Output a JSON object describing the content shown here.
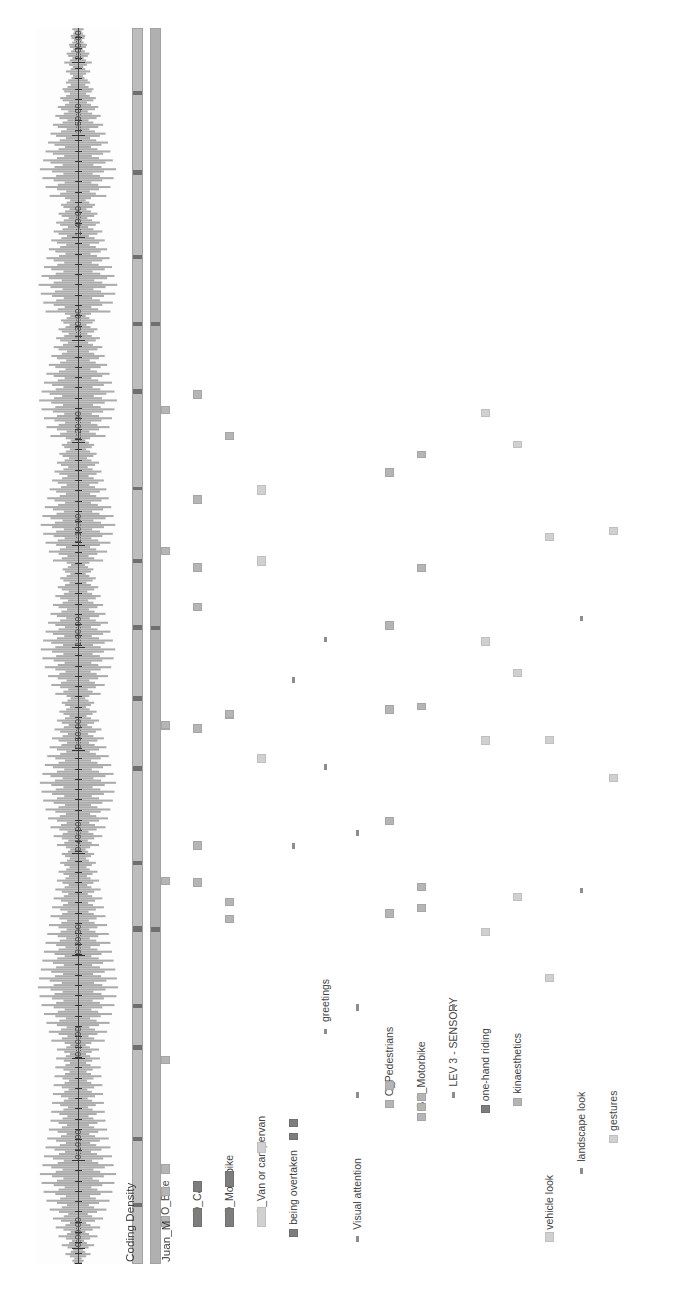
{
  "app": {
    "title": "ELAN Annotation Timeline",
    "orientation": "rotated-90-ccw"
  },
  "colors": {
    "background": "#ffffff",
    "waveform": "#8c8c8c",
    "waveform_axis": "#2a2a2a",
    "strip_fill": "#b6b6b6",
    "strip_segment": "#6f6f6f",
    "annotation_default": "#9a9a9a",
    "annotation_light": "#d0d0d0",
    "annotation_dark": "#7d7d7d",
    "text": "#3c3c3c"
  },
  "tracks": {
    "waveform_name": "",
    "density_name": "Coding Density",
    "participant_name": "Juan_M"
  },
  "timeline": {
    "axis_label": "time",
    "ticks": [
      {
        "label": "0:00:00",
        "pos": 0.012
      },
      {
        "label": "0:10:00",
        "pos": 0.083
      },
      {
        "label": "0:20:00",
        "pos": 0.166
      },
      {
        "label": "0:30:00",
        "pos": 0.249
      },
      {
        "label": "0:40:00",
        "pos": 0.332
      },
      {
        "label": "0:50:00",
        "pos": 0.415
      },
      {
        "label": "1:00:00",
        "pos": 0.498
      },
      {
        "label": "1:10:00",
        "pos": 0.581
      },
      {
        "label": "1:20:00",
        "pos": 0.664
      },
      {
        "label": "1:30:00",
        "pos": 0.747
      },
      {
        "label": "1:40:00",
        "pos": 0.83
      },
      {
        "label": "1:50:00",
        "pos": 0.913
      },
      {
        "label": "2:00:00",
        "pos": 0.972
      }
    ]
  },
  "tiers": [
    {
      "label": "O_Bike",
      "row": 0,
      "annotations": [
        {
          "x": 0.03,
          "w": 0.0085,
          "shade": "mid"
        },
        {
          "x": 0.055,
          "w": 0.0075,
          "shade": "mid"
        },
        {
          "x": 0.073,
          "w": 0.008,
          "shade": "mid"
        },
        {
          "x": 0.162,
          "w": 0.006,
          "shade": "mid"
        },
        {
          "x": 0.307,
          "w": 0.006,
          "shade": "mid"
        },
        {
          "x": 0.432,
          "w": 0.006,
          "shade": "mid"
        },
        {
          "x": 0.433,
          "w": 0.006,
          "shade": "mid"
        },
        {
          "x": 0.574,
          "w": 0.006,
          "shade": "mid"
        },
        {
          "x": 0.688,
          "w": 0.006,
          "shade": "mid"
        }
      ]
    },
    {
      "label": "O_Car",
      "row": 1,
      "annotations": [
        {
          "x": 0.03,
          "w": 0.015,
          "shade": "dark"
        },
        {
          "x": 0.058,
          "w": 0.009,
          "shade": "dark"
        },
        {
          "x": 0.305,
          "w": 0.007,
          "shade": "mid"
        },
        {
          "x": 0.335,
          "w": 0.007,
          "shade": "mid"
        },
        {
          "x": 0.43,
          "w": 0.007,
          "shade": "mid"
        },
        {
          "x": 0.528,
          "w": 0.007,
          "shade": "mid"
        },
        {
          "x": 0.56,
          "w": 0.007,
          "shade": "mid"
        },
        {
          "x": 0.615,
          "w": 0.007,
          "shade": "mid"
        },
        {
          "x": 0.7,
          "w": 0.007,
          "shade": "mid"
        }
      ]
    },
    {
      "label": "O_Motorbike",
      "row": 2,
      "annotations": [
        {
          "x": 0.03,
          "w": 0.015,
          "shade": "dark"
        },
        {
          "x": 0.062,
          "w": 0.013,
          "shade": "dark"
        },
        {
          "x": 0.276,
          "w": 0.006,
          "shade": "mid"
        },
        {
          "x": 0.29,
          "w": 0.006,
          "shade": "mid"
        },
        {
          "x": 0.441,
          "w": 0.006,
          "shade": "mid"
        },
        {
          "x": 0.442,
          "w": 0.006,
          "shade": "mid"
        },
        {
          "x": 0.667,
          "w": 0.006,
          "shade": "mid"
        }
      ]
    },
    {
      "label": "O_Van or campervan",
      "row": 3,
      "annotations": [
        {
          "x": 0.03,
          "w": 0.016,
          "shade": "light"
        },
        {
          "x": 0.09,
          "w": 0.0085,
          "shade": "light"
        },
        {
          "x": 0.405,
          "w": 0.008,
          "shade": "light"
        },
        {
          "x": 0.565,
          "w": 0.008,
          "shade": "light"
        },
        {
          "x": 0.622,
          "w": 0.008,
          "shade": "light"
        }
      ]
    },
    {
      "label": "being overtaken",
      "row": 4,
      "annotations": [
        {
          "x": 0.022,
          "w": 0.0065,
          "shade": "dark"
        },
        {
          "x": 0.1,
          "w": 0.006,
          "shade": "dark"
        },
        {
          "x": 0.111,
          "w": 0.006,
          "shade": "dark"
        },
        {
          "x": 0.336,
          "w": 0.005,
          "shade": "thin"
        },
        {
          "x": 0.47,
          "w": 0.005,
          "shade": "thin"
        }
      ]
    },
    {
      "label": "greetings",
      "row": 5,
      "annotations": [
        {
          "x": 0.186,
          "w": 0.0045,
          "shade": "thin"
        },
        {
          "x": 0.4,
          "w": 0.0045,
          "shade": "thin"
        },
        {
          "x": 0.503,
          "w": 0.0045,
          "shade": "thin"
        }
      ]
    },
    {
      "label": "Visual attention",
      "row": 6,
      "annotations": [
        {
          "x": 0.018,
          "w": 0.005,
          "shade": "thin"
        },
        {
          "x": 0.134,
          "w": 0.005,
          "shade": "thin"
        },
        {
          "x": 0.205,
          "w": 0.005,
          "shade": "thin"
        },
        {
          "x": 0.346,
          "w": 0.005,
          "shade": "thin"
        }
      ]
    },
    {
      "label": "O_Pedestrians",
      "row": 7,
      "annotations": [
        {
          "x": 0.126,
          "w": 0.007,
          "shade": "mid"
        },
        {
          "x": 0.141,
          "w": 0.007,
          "shade": "mid"
        },
        {
          "x": 0.28,
          "w": 0.007,
          "shade": "mid"
        },
        {
          "x": 0.355,
          "w": 0.007,
          "shade": "mid"
        },
        {
          "x": 0.445,
          "w": 0.007,
          "shade": "mid"
        },
        {
          "x": 0.513,
          "w": 0.007,
          "shade": "mid"
        },
        {
          "x": 0.637,
          "w": 0.007,
          "shade": "mid"
        }
      ]
    },
    {
      "label": "BO_Motorbike",
      "row": 8,
      "annotations": [
        {
          "x": 0.116,
          "w": 0.006,
          "shade": "mid"
        },
        {
          "x": 0.124,
          "w": 0.006,
          "shade": "mid"
        },
        {
          "x": 0.132,
          "w": 0.006,
          "shade": "mid"
        },
        {
          "x": 0.285,
          "w": 0.006,
          "shade": "mid"
        },
        {
          "x": 0.302,
          "w": 0.006,
          "shade": "mid"
        },
        {
          "x": 0.448,
          "w": 0.006,
          "shade": "mid"
        },
        {
          "x": 0.56,
          "w": 0.006,
          "shade": "mid"
        },
        {
          "x": 0.652,
          "w": 0.006,
          "shade": "mid"
        }
      ]
    },
    {
      "label": "LEV 3 - SENSORY",
      "row": 9,
      "annotations": [
        {
          "x": 0.134,
          "w": 0.005,
          "shade": "thin"
        },
        {
          "x": 0.205,
          "w": 0.005,
          "shade": "thin"
        }
      ]
    },
    {
      "label": "one-hand riding",
      "row": 10,
      "annotations": [
        {
          "x": 0.122,
          "w": 0.007,
          "shade": "dark"
        },
        {
          "x": 0.265,
          "w": 0.007,
          "shade": "light"
        },
        {
          "x": 0.42,
          "w": 0.007,
          "shade": "light"
        },
        {
          "x": 0.5,
          "w": 0.007,
          "shade": "light"
        },
        {
          "x": 0.685,
          "w": 0.007,
          "shade": "light"
        }
      ]
    },
    {
      "label": "kinaesthetics",
      "row": 11,
      "annotations": [
        {
          "x": 0.128,
          "w": 0.006,
          "shade": "mid"
        },
        {
          "x": 0.294,
          "w": 0.006,
          "shade": "light"
        },
        {
          "x": 0.475,
          "w": 0.006,
          "shade": "light"
        },
        {
          "x": 0.66,
          "w": 0.006,
          "shade": "light"
        }
      ]
    },
    {
      "label": "vehicle look",
      "row": 12,
      "annotations": [
        {
          "x": 0.018,
          "w": 0.0075,
          "shade": "light"
        },
        {
          "x": 0.228,
          "w": 0.0065,
          "shade": "light"
        },
        {
          "x": 0.421,
          "w": 0.0065,
          "shade": "light"
        },
        {
          "x": 0.585,
          "w": 0.0065,
          "shade": "light"
        }
      ]
    },
    {
      "label": "landscape look",
      "row": 13,
      "annotations": [
        {
          "x": 0.073,
          "w": 0.0045,
          "shade": "thin"
        },
        {
          "x": 0.3,
          "w": 0.0045,
          "shade": "thin"
        },
        {
          "x": 0.52,
          "w": 0.0045,
          "shade": "thin"
        }
      ]
    },
    {
      "label": "gestures",
      "row": 14,
      "annotations": [
        {
          "x": 0.098,
          "w": 0.0065,
          "shade": "light"
        },
        {
          "x": 0.39,
          "w": 0.0065,
          "shade": "light"
        },
        {
          "x": 0.59,
          "w": 0.0065,
          "shade": "light"
        }
      ]
    }
  ],
  "density_segments": [
    {
      "x": 0.045,
      "w": 0.0035
    },
    {
      "x": 0.099,
      "w": 0.003
    },
    {
      "x": 0.172,
      "w": 0.004
    },
    {
      "x": 0.206,
      "w": 0.0035
    },
    {
      "x": 0.268,
      "w": 0.005
    },
    {
      "x": 0.322,
      "w": 0.0035
    },
    {
      "x": 0.398,
      "w": 0.004
    },
    {
      "x": 0.455,
      "w": 0.0035
    },
    {
      "x": 0.512,
      "w": 0.0045
    },
    {
      "x": 0.566,
      "w": 0.0035
    },
    {
      "x": 0.625,
      "w": 0.003
    },
    {
      "x": 0.703,
      "w": 0.0045
    },
    {
      "x": 0.758,
      "w": 0.003
    },
    {
      "x": 0.812,
      "w": 0.0035
    },
    {
      "x": 0.88,
      "w": 0.004
    },
    {
      "x": 0.945,
      "w": 0.003
    }
  ],
  "participant_segments": [
    {
      "x": 0.268,
      "w": 0.0035
    },
    {
      "x": 0.512,
      "w": 0.0035
    },
    {
      "x": 0.758,
      "w": 0.003
    }
  ],
  "waveform": {
    "sample_count": 560,
    "peaks": [
      0.1,
      0.14,
      0.09,
      0.2,
      0.31,
      0.18,
      0.12,
      0.26,
      0.4,
      0.22,
      0.15,
      0.3,
      0.48,
      0.27,
      0.18,
      0.36,
      0.55,
      0.31,
      0.2,
      0.42,
      0.62,
      0.35,
      0.24,
      0.47,
      0.7,
      0.4,
      0.27,
      0.52,
      0.78,
      0.44,
      0.3,
      0.56,
      0.85,
      0.48,
      0.33,
      0.6,
      0.9,
      0.52,
      0.36,
      0.64,
      0.94,
      0.55,
      0.38,
      0.66,
      0.88,
      0.5,
      0.35,
      0.62,
      0.84,
      0.47,
      0.32,
      0.58,
      0.8,
      0.45,
      0.3,
      0.54,
      0.76,
      0.42,
      0.28,
      0.5,
      0.72,
      0.4,
      0.27,
      0.48,
      0.68,
      0.38,
      0.26,
      0.46,
      0.66,
      0.36,
      0.25,
      0.44,
      0.64,
      0.35,
      0.24,
      0.42,
      0.62,
      0.34,
      0.23,
      0.4,
      0.6,
      0.33,
      0.22,
      0.38,
      0.58,
      0.32,
      0.21,
      0.36,
      0.56,
      0.31,
      0.2,
      0.35,
      0.54,
      0.3,
      0.2,
      0.34,
      0.52,
      0.29,
      0.19,
      0.33,
      0.66,
      0.4,
      0.26,
      0.48,
      0.72,
      0.42,
      0.28,
      0.52,
      0.78,
      0.46,
      0.3,
      0.56,
      0.84,
      0.5,
      0.33,
      0.6,
      0.9,
      0.54,
      0.36,
      0.64,
      0.95,
      0.58,
      0.38,
      0.68,
      0.99,
      0.6,
      0.4,
      0.7,
      0.96,
      0.57,
      0.37,
      0.66,
      0.92,
      0.54,
      0.35,
      0.62,
      0.88,
      0.51,
      0.33,
      0.58,
      0.84,
      0.48,
      0.31,
      0.54,
      0.8,
      0.45,
      0.29,
      0.5,
      0.76,
      0.43,
      0.28,
      0.48,
      0.72,
      0.41,
      0.27,
      0.46,
      0.68,
      0.39,
      0.26,
      0.44,
      0.64,
      0.37,
      0.25,
      0.42,
      0.6,
      0.35,
      0.24,
      0.4,
      0.56,
      0.33,
      0.23,
      0.38,
      0.52,
      0.31,
      0.22,
      0.36,
      0.48,
      0.29,
      0.21,
      0.34,
      0.44,
      0.27,
      0.2,
      0.32,
      0.4,
      0.25,
      0.19,
      0.3,
      0.52,
      0.34,
      0.24,
      0.4,
      0.6,
      0.38,
      0.26,
      0.46,
      0.68,
      0.42,
      0.28,
      0.52,
      0.74,
      0.45,
      0.3,
      0.56,
      0.8,
      0.48,
      0.32,
      0.6,
      0.86,
      0.52,
      0.34,
      0.64,
      0.9,
      0.55,
      0.36,
      0.66,
      0.94,
      0.57,
      0.38,
      0.68,
      0.88,
      0.52,
      0.34,
      0.62,
      0.82,
      0.48,
      0.32,
      0.56,
      0.76,
      0.44,
      0.29,
      0.52,
      0.7,
      0.41,
      0.27,
      0.48,
      0.64,
      0.38,
      0.25,
      0.44,
      0.58,
      0.35,
      0.23,
      0.4,
      0.52,
      0.32,
      0.21,
      0.36,
      0.46,
      0.29,
      0.2,
      0.32,
      0.4,
      0.26,
      0.18,
      0.28,
      0.56,
      0.36,
      0.24,
      0.44,
      0.66,
      0.42,
      0.28,
      0.5,
      0.74,
      0.46,
      0.31,
      0.56,
      0.82,
      0.5,
      0.33,
      0.6,
      0.88,
      0.54,
      0.36,
      0.64,
      0.92,
      0.56,
      0.37,
      0.66,
      0.86,
      0.52,
      0.34,
      0.62,
      0.8,
      0.48,
      0.32,
      0.56,
      0.74,
      0.44,
      0.29,
      0.52,
      0.68,
      0.41,
      0.27,
      0.48,
      0.62,
      0.38,
      0.25,
      0.44,
      0.56,
      0.35,
      0.23,
      0.4,
      0.5,
      0.32,
      0.21,
      0.36,
      0.44,
      0.28,
      0.19,
      0.32,
      0.38,
      0.25,
      0.17,
      0.28,
      0.62,
      0.4,
      0.26,
      0.48,
      0.72,
      0.45,
      0.3,
      0.54,
      0.8,
      0.5,
      0.33,
      0.6,
      0.86,
      0.54,
      0.35,
      0.64,
      0.92,
      0.57,
      0.38,
      0.68,
      0.88,
      0.53,
      0.35,
      0.62,
      0.82,
      0.49,
      0.32,
      0.58,
      0.76,
      0.45,
      0.3,
      0.54,
      0.7,
      0.42,
      0.28,
      0.5,
      0.64,
      0.39,
      0.26,
      0.46,
      0.58,
      0.36,
      0.24,
      0.42,
      0.52,
      0.33,
      0.22,
      0.38,
      0.46,
      0.3,
      0.2,
      0.34,
      0.4,
      0.27,
      0.18,
      0.3,
      0.68,
      0.44,
      0.28,
      0.52,
      0.78,
      0.48,
      0.32,
      0.58,
      0.84,
      0.52,
      0.34,
      0.62,
      0.9,
      0.56,
      0.37,
      0.66,
      0.96,
      0.59,
      0.39,
      0.7,
      0.9,
      0.55,
      0.36,
      0.64,
      0.84,
      0.5,
      0.33,
      0.6,
      0.78,
      0.47,
      0.31,
      0.56,
      0.72,
      0.44,
      0.29,
      0.52,
      0.66,
      0.4,
      0.27,
      0.48,
      0.6,
      0.37,
      0.25,
      0.44,
      0.54,
      0.34,
      0.23,
      0.4,
      0.48,
      0.31,
      0.21,
      0.36,
      0.42,
      0.28,
      0.19,
      0.32,
      0.8,
      0.5,
      0.33,
      0.6,
      0.86,
      0.54,
      0.35,
      0.64,
      0.92,
      0.57,
      0.38,
      0.68,
      0.97,
      0.6,
      0.4,
      0.72,
      0.9,
      0.55,
      0.36,
      0.66,
      0.84,
      0.51,
      0.34,
      0.6,
      0.78,
      0.47,
      0.31,
      0.56,
      0.72,
      0.44,
      0.29,
      0.52,
      0.66,
      0.41,
      0.27,
      0.48,
      0.6,
      0.38,
      0.25,
      0.44,
      0.54,
      0.35,
      0.23,
      0.4,
      0.48,
      0.32,
      0.21,
      0.36,
      0.42,
      0.28,
      0.19,
      0.32,
      0.7,
      0.44,
      0.29,
      0.52,
      0.8,
      0.5,
      0.33,
      0.6,
      0.88,
      0.54,
      0.36,
      0.64,
      0.94,
      0.58,
      0.38,
      0.68,
      0.86,
      0.52,
      0.34,
      0.62,
      0.8,
      0.48,
      0.32,
      0.58,
      0.74,
      0.45,
      0.3,
      0.54,
      0.68,
      0.42,
      0.28,
      0.5,
      0.62,
      0.38,
      0.26,
      0.46,
      0.56,
      0.35,
      0.24,
      0.42,
      0.5,
      0.32,
      0.22,
      0.38,
      0.44,
      0.29,
      0.2,
      0.34,
      0.38,
      0.26,
      0.18,
      0.3,
      0.24,
      0.16,
      0.12,
      0.2,
      0.3,
      0.18,
      0.13,
      0.22,
      0.34,
      0.2,
      0.14,
      0.24,
      0.28,
      0.17,
      0.12,
      0.2,
      0.22,
      0.14,
      0.1,
      0.16,
      0.18,
      0.12,
      0.09,
      0.14
    ]
  }
}
